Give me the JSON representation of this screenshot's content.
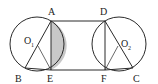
{
  "diagram": {
    "type": "geometry",
    "colors": {
      "stroke": "#2a2a2a",
      "shade": "#c8c8c8",
      "background": "#ffffff"
    },
    "points": {
      "A": {
        "label": "A",
        "x": 51,
        "y": 21
      },
      "B": {
        "label": "B",
        "x": 25,
        "y": 68
      },
      "C": {
        "label": "C",
        "x": 133,
        "y": 68
      },
      "D": {
        "label": "D",
        "x": 105,
        "y": 21
      },
      "E": {
        "label": "E",
        "x": 51,
        "y": 70
      },
      "F": {
        "label": "F",
        "x": 105,
        "y": 70
      },
      "O1": {
        "label": "O",
        "sub": "1",
        "x": 37,
        "y": 44
      },
      "O2": {
        "label": "O",
        "sub": "2",
        "x": 119,
        "y": 44
      }
    },
    "circles": [
      {
        "name": "circle-O1",
        "cx": 37,
        "cy": 44,
        "r": 27
      },
      {
        "name": "circle-O2",
        "cx": 119,
        "cy": 44,
        "r": 27
      }
    ],
    "segments": [
      "AD",
      "EF",
      "AE",
      "DF",
      "AB",
      "DC",
      "O1E",
      "O2F",
      "BE",
      "FC"
    ],
    "shaded_region": "segment of circle O1 between chord AE and arc AE"
  }
}
